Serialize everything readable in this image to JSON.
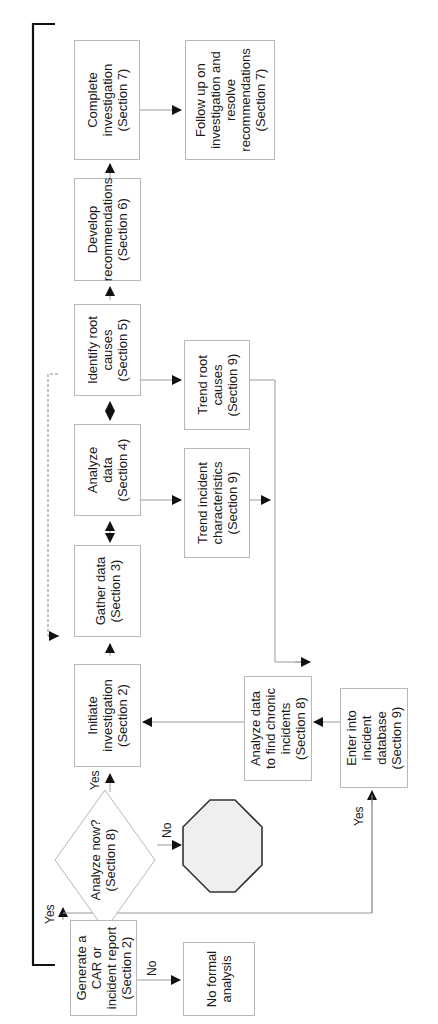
{
  "title": {
    "line1": "SOURCE™ Methodology Flowchart",
    "line2": "Overall Incident Investigation Program Management System (Section 10)"
  },
  "nodes": {
    "generate_report": "Generate a\nCAR or\nincident report\n(Section 2)",
    "no_formal_analysis": "No formal\nanalysis",
    "analyze_now": "Analyze now?\n(Section 8)",
    "stop": "",
    "initiate_investigation": "Initiate\ninvestigation\n(Section 2)",
    "gather_data": "Gather data\n(Section 3)",
    "analyze_data": "Analyze\ndata\n(Section 4)",
    "identify_root_causes": "Identify root\ncauses\n(Section 5)",
    "develop_recommendations": "Develop\nrecommendations\n(Section 6)",
    "complete_investigation": "Complete\ninvestigation\n(Section 7)",
    "follow_up": "Follow up on\ninvestigation and\nresolve\nrecommendations\n(Section 7)",
    "trend_incident_characteristics": "Trend incident\ncharacteristics\n(Section 9)",
    "trend_root_causes": "Trend root\ncauses\n(Section 9)",
    "analyze_chronic": "Analyze data\nto find chronic\nincidents\n(Section 8)",
    "enter_database": "Enter into\nincident\ndatabase\n(Section 9)"
  },
  "edge_labels": {
    "report_yes": "Yes",
    "report_no": "No",
    "analyze_now_yes": "Yes",
    "analyze_now_no": "No",
    "database_yes": "Yes"
  },
  "colors": {
    "box_border": "#b8b8b8",
    "line": "#9a9a9a",
    "arrow": "#111111",
    "frame": "#111111",
    "stop_fill": "#efefef",
    "stop_border": "#333333"
  }
}
